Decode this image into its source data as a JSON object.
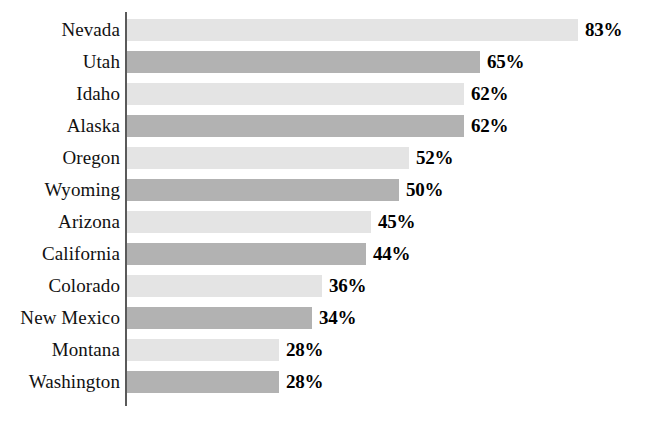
{
  "chart_data": {
    "type": "bar",
    "orientation": "horizontal",
    "title": "",
    "subtitle": "",
    "xlabel": "",
    "ylabel": "",
    "xlim": [
      0,
      100
    ],
    "grid": false,
    "legend": null,
    "value_suffix": "%",
    "categories": [
      "Nevada",
      "Utah",
      "Idaho",
      "Alaska",
      "Oregon",
      "Wyoming",
      "Arizona",
      "California",
      "Colorado",
      "New Mexico",
      "Montana",
      "Washington"
    ],
    "values": [
      83,
      65,
      62,
      62,
      52,
      50,
      45,
      44,
      36,
      34,
      28,
      28
    ],
    "value_labels": [
      "83%",
      "65%",
      "62%",
      "62%",
      "52%",
      "50%",
      "45%",
      "44%",
      "36%",
      "34%",
      "28%",
      "28%"
    ],
    "bars": [
      {
        "category": "Nevada",
        "value": 83,
        "label": "83%",
        "shade": "light"
      },
      {
        "category": "Utah",
        "value": 65,
        "label": "65%",
        "shade": "dark"
      },
      {
        "category": "Idaho",
        "value": 62,
        "label": "62%",
        "shade": "light"
      },
      {
        "category": "Alaska",
        "value": 62,
        "label": "62%",
        "shade": "dark"
      },
      {
        "category": "Oregon",
        "value": 52,
        "label": "52%",
        "shade": "light"
      },
      {
        "category": "Wyoming",
        "value": 50,
        "label": "50%",
        "shade": "dark"
      },
      {
        "category": "Arizona",
        "value": 45,
        "label": "45%",
        "shade": "light"
      },
      {
        "category": "California",
        "value": 44,
        "label": "44%",
        "shade": "dark"
      },
      {
        "category": "Colorado",
        "value": 36,
        "label": "36%",
        "shade": "light"
      },
      {
        "category": "New Mexico",
        "value": 34,
        "label": "34%",
        "shade": "dark"
      },
      {
        "category": "Montana",
        "value": 28,
        "label": "28%",
        "shade": "light"
      },
      {
        "category": "Washington",
        "value": 28,
        "label": "28%",
        "shade": "dark"
      }
    ],
    "colors": {
      "bar_light": "#e4e4e4",
      "bar_dark": "#b2b2b2",
      "axis": "#5a5a5a",
      "text": "#111111",
      "value_text": "#000000",
      "background": "#ffffff"
    }
  },
  "layout": {
    "axis_x": 125,
    "axis_top": 12,
    "axis_height": 394,
    "bar_start_x": 127,
    "row_pitch": 32,
    "row_top": 14,
    "bar_height": 22,
    "px_per_unit": 5.43,
    "value_gap": 7
  }
}
